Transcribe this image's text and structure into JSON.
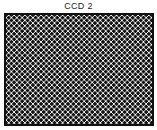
{
  "diagram": {
    "title": "CCD 2",
    "element": "ccd-sensor-grid",
    "pattern": "checkerboard-dots",
    "colors": {
      "dots": "#111111",
      "background": "#ffffff",
      "border": "#111111"
    }
  }
}
